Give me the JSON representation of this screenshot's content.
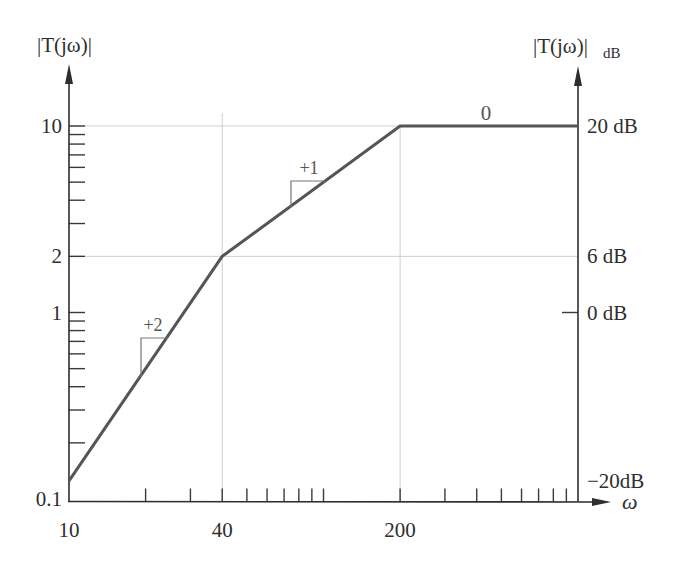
{
  "chart_data": {
    "type": "line",
    "title": "",
    "subtitle": "Asymptotic Bode magnitude plot",
    "scale": {
      "x": "log",
      "y": "log"
    },
    "xlabel": "ω",
    "ylabel": "|T(jω)|",
    "ylabel_right": "|T(jω)|",
    "ylabel_right_subscript": "dB",
    "xlim": [
      10,
      1000
    ],
    "ylim": [
      0.1,
      10
    ],
    "grid": {
      "on": true,
      "horizontal": [
        10,
        2
      ],
      "vertical": [
        40,
        200
      ]
    },
    "legend": null,
    "x": [
      10,
      40,
      200,
      1000
    ],
    "series": [
      {
        "name": "|T(jω)| asymptote",
        "x": [
          10,
          40,
          200,
          1000
        ],
        "values": [
          0.125,
          2,
          10,
          10
        ],
        "color": "#555555"
      }
    ],
    "x_ticks": [
      {
        "value": 10,
        "label": "10"
      },
      {
        "value": 40,
        "label": "40"
      },
      {
        "value": 200,
        "label": "200"
      }
    ],
    "x_minor_ticks": [
      20,
      30,
      40,
      50,
      60,
      70,
      80,
      90,
      100,
      200,
      300,
      400,
      500,
      600,
      700,
      800,
      900
    ],
    "y_ticks_left": [
      {
        "value": 0.1,
        "label": "0.1"
      },
      {
        "value": 1,
        "label": "1"
      },
      {
        "value": 2,
        "label": "2"
      },
      {
        "value": 10,
        "label": "10"
      }
    ],
    "y_minor_ticks_left": [
      0.2,
      0.3,
      0.4,
      0.5,
      0.6,
      0.7,
      0.8,
      0.9,
      1,
      2,
      3,
      4,
      5,
      6,
      7,
      8,
      9,
      10
    ],
    "y_ticks_right": [
      {
        "value": 10,
        "label": "20 dB"
      },
      {
        "value": 2,
        "label": "6 dB"
      },
      {
        "value": 1,
        "label": "0 dB",
        "tick": true
      },
      {
        "value": 0.1,
        "label": "−20dB"
      }
    ],
    "annotations": [
      {
        "text": "+2",
        "meaning": "slope +2 between ω=10 and ω=40"
      },
      {
        "text": "+1",
        "meaning": "slope +1 between ω=40 and ω=200"
      },
      {
        "text": "0",
        "meaning": "slope 0 above ω=200"
      }
    ]
  }
}
